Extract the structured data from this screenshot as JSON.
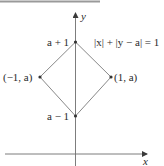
{
  "figure": {
    "equation": "|x| + |y − a| = 1",
    "axes": {
      "x_label": "x",
      "y_label": "y"
    },
    "vertices": {
      "top": {
        "label": "a + 1"
      },
      "bottom": {
        "label": "a − 1"
      },
      "left": {
        "label": "(−1, a)"
      },
      "right": {
        "label": "(1, a)"
      }
    },
    "colors": {
      "line": "#6e6e6e",
      "text": "#2a2a2a",
      "rule": "#9a9a9a"
    }
  }
}
